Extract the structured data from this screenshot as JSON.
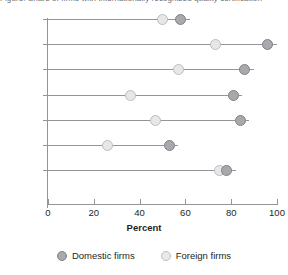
{
  "title_clipped": "Figure: Share of firms with internationally recognized quality certification",
  "chart_data": {
    "type": "scatter",
    "title": "",
    "xlabel": "Percent",
    "ylabel": "",
    "xlim": [
      0,
      100
    ],
    "xticks": [
      0,
      20,
      40,
      60,
      80,
      100
    ],
    "xtick_labels": [
      "0",
      "20",
      "40",
      "60",
      "80",
      "100"
    ],
    "grid": false,
    "legend_position": "bottom",
    "categories": [
      "Bulgaria",
      "China",
      "Germany",
      "Poland",
      "Portugal",
      "Romania",
      "Turkey"
    ],
    "series": [
      {
        "name": "Domestic firms",
        "color": "#a7a9ac",
        "values": [
          58,
          96,
          86,
          81,
          84,
          53,
          78
        ]
      },
      {
        "name": "Foreign firms",
        "color": "#e6e7e8",
        "values": [
          50,
          73,
          57,
          36,
          47,
          26,
          75
        ]
      }
    ]
  },
  "legend": {
    "items": [
      {
        "label": "Domestic firms",
        "swatch": "domestic"
      },
      {
        "label": "Foreign firms",
        "swatch": "foreign"
      }
    ]
  }
}
